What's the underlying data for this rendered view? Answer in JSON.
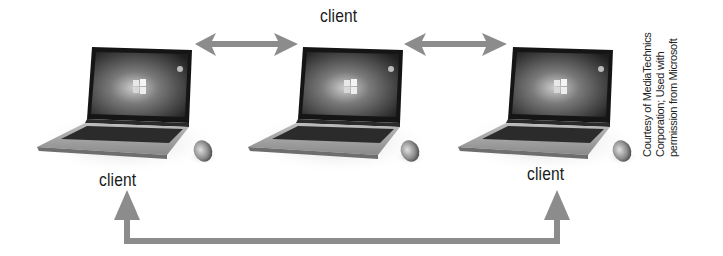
{
  "diagram": {
    "type": "peer-to-peer network",
    "nodes": [
      {
        "id": "laptop-left",
        "label": "client"
      },
      {
        "id": "laptop-middle",
        "label": "client"
      },
      {
        "id": "laptop-right",
        "label": "client"
      }
    ],
    "connections": [
      {
        "from": "laptop-left",
        "to": "laptop-middle",
        "style": "double-arrow"
      },
      {
        "from": "laptop-middle",
        "to": "laptop-right",
        "style": "double-arrow"
      },
      {
        "from": "laptop-left",
        "to": "laptop-right",
        "style": "bracket-double-arrow-below"
      }
    ],
    "arrow_color": "#8c8c8c"
  },
  "labels": {
    "top": "client",
    "left": "client",
    "right": "client"
  },
  "credit": {
    "line1": "Courtesy of MediaTechnics",
    "line2": "Corporation; Used with",
    "line3": "permission from Microsoft"
  }
}
